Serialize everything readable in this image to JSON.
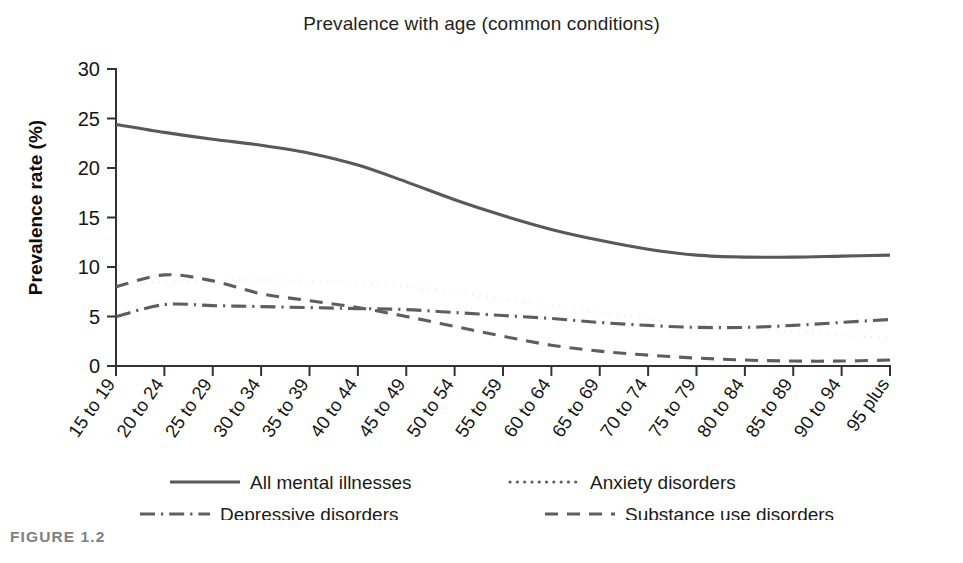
{
  "figure": {
    "caption": "FIGURE 1.2"
  },
  "chart_data": {
    "type": "line",
    "title": "Prevalence with age (common conditions)",
    "xlabel": "",
    "ylabel": "Prevalence rate (%)",
    "ylim": [
      0,
      30
    ],
    "yticks": [
      0,
      5,
      10,
      15,
      20,
      25,
      30
    ],
    "ytick_labels": [
      "0",
      "5",
      "10",
      "15",
      "20",
      "25",
      "30"
    ],
    "grid": false,
    "legend_position": "bottom",
    "categories": [
      "15 to 19",
      "20 to 24",
      "25 to 29",
      "30 to 34",
      "35 to 39",
      "40 to 44",
      "45 to 49",
      "50 to 54",
      "55 to 59",
      "60 to 64",
      "65 to 69",
      "70 to 74",
      "75 to 79",
      "80 to 84",
      "85 to 89",
      "90 to 94",
      "95 plus"
    ],
    "series": [
      {
        "name": "All mental illnesses",
        "style": "solid",
        "color": "#595959",
        "values": [
          24.4,
          23.6,
          22.9,
          22.3,
          21.5,
          20.3,
          18.6,
          16.8,
          15.2,
          13.8,
          12.7,
          11.8,
          11.2,
          11.0,
          11.0,
          11.1,
          11.2
        ]
      },
      {
        "name": "Anxiety disorders",
        "style": "dotted",
        "color": "#5e5e5e",
        "values": [
          8.0,
          8.5,
          8.6,
          8.7,
          8.6,
          8.4,
          8.1,
          7.5,
          6.8,
          6.1,
          5.4,
          4.7,
          4.2,
          3.9,
          3.5,
          3.1,
          2.8
        ]
      },
      {
        "name": "Depressive disorders",
        "style": "dashdot",
        "color": "#5e5e5e",
        "values": [
          5.0,
          6.2,
          6.1,
          6.0,
          5.9,
          5.8,
          5.7,
          5.4,
          5.1,
          4.8,
          4.4,
          4.1,
          3.9,
          3.9,
          4.1,
          4.4,
          4.7
        ]
      },
      {
        "name": "Substance use disorders",
        "style": "dashed",
        "color": "#5e5e5e",
        "values": [
          8.0,
          9.2,
          8.6,
          7.3,
          6.6,
          5.9,
          5.0,
          4.0,
          3.0,
          2.1,
          1.5,
          1.1,
          0.8,
          0.6,
          0.5,
          0.5,
          0.6
        ]
      }
    ]
  }
}
